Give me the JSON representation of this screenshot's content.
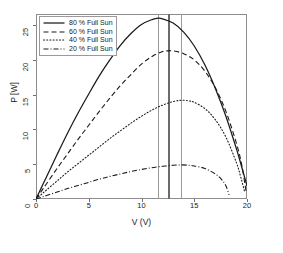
{
  "chart_data": {
    "type": "line",
    "title": "",
    "xlabel": "V (V)",
    "ylabel": "P [W]",
    "xlim": [
      0,
      20
    ],
    "ylim": [
      0,
      26.6
    ],
    "xticks": [
      "0",
      "5",
      "10",
      "15",
      "20"
    ],
    "xtick_values": [
      0,
      5,
      10,
      15,
      20
    ],
    "yticks": [
      "0",
      "5",
      "10",
      "15",
      "20",
      "25"
    ],
    "ytick_values": [
      0,
      5,
      10,
      15,
      20,
      25
    ],
    "grid": false,
    "legend_position": "upper left",
    "series": [
      {
        "name": "80 % Full Sun",
        "style": "solid",
        "color": "#1a1a1a",
        "peak_v": 11.6,
        "peak_p": 26.0,
        "v_end": 20.0,
        "x": [
          0,
          0.5,
          1,
          2,
          3,
          4,
          5,
          6,
          7,
          8,
          9,
          10,
          11,
          11.6,
          12,
          13,
          14,
          15,
          16,
          17,
          18,
          19,
          19.5,
          20
        ],
        "y": [
          0,
          1.6,
          3.2,
          6.4,
          9.5,
          12.4,
          15.1,
          17.7,
          20.0,
          22.1,
          23.8,
          25.1,
          25.8,
          26.0,
          25.9,
          25.3,
          24.0,
          22.0,
          19.3,
          15.9,
          11.9,
          7.2,
          4.6,
          1.9
        ]
      },
      {
        "name": "60 % Full Sun",
        "style": "dashed",
        "color": "#1a1a1a",
        "peak_v": 12.6,
        "peak_p": 21.3,
        "v_end": 19.9,
        "x": [
          0,
          0.5,
          1,
          2,
          3,
          4,
          5,
          6,
          7,
          8,
          9,
          10,
          11,
          12,
          12.6,
          13,
          14,
          15,
          16,
          17,
          18,
          19,
          19.5,
          19.9
        ],
        "y": [
          0,
          1.1,
          2.2,
          4.4,
          6.5,
          8.6,
          10.6,
          12.6,
          14.5,
          16.3,
          17.9,
          19.4,
          20.5,
          21.2,
          21.3,
          21.3,
          20.9,
          20.0,
          18.4,
          16.0,
          12.6,
          8.0,
          4.9,
          1.2
        ]
      },
      {
        "name": "40 % Full Sun",
        "style": "dotted",
        "color": "#1a1a1a",
        "peak_v": 13.8,
        "peak_p": 14.2,
        "v_end": 19.8,
        "x": [
          0,
          0.5,
          1,
          2,
          3,
          4,
          5,
          6,
          7,
          8,
          9,
          10,
          11,
          12,
          13,
          13.8,
          14.5,
          15,
          16,
          17,
          18,
          19,
          19.4,
          19.8
        ],
        "y": [
          0,
          0.65,
          1.3,
          2.6,
          3.9,
          5.1,
          6.3,
          7.5,
          8.7,
          9.8,
          10.9,
          11.9,
          12.8,
          13.5,
          14.0,
          14.2,
          14.1,
          13.9,
          13.0,
          11.4,
          8.9,
          5.2,
          3.2,
          0.9
        ]
      },
      {
        "name": "20 % Full Sun",
        "style": "dashdot",
        "color": "#1a1a1a",
        "peak_v": 13.8,
        "peak_p": 4.9,
        "v_end": 18.3,
        "x": [
          0,
          0.5,
          1,
          2,
          3,
          4,
          5,
          6,
          7,
          8,
          9,
          10,
          11,
          12,
          13,
          13.8,
          14.5,
          15,
          16,
          17,
          17.6,
          18,
          18.3
        ],
        "y": [
          0,
          0.25,
          0.5,
          1.0,
          1.5,
          1.95,
          2.4,
          2.85,
          3.25,
          3.6,
          3.95,
          4.25,
          4.5,
          4.7,
          4.85,
          4.9,
          4.85,
          4.75,
          4.4,
          3.6,
          2.8,
          1.9,
          0.6
        ]
      }
    ],
    "reference_lines": [
      {
        "name": "vline-1",
        "v": 11.6,
        "color": "#9a9a9a",
        "width": 1
      },
      {
        "name": "vline-2",
        "v": 12.6,
        "color": "#6b6b6b",
        "width": 2
      },
      {
        "name": "vline-3",
        "v": 13.8,
        "color": "#9a9a9a",
        "width": 1
      }
    ]
  },
  "legend": {
    "entries": [
      {
        "label": "80 % Full Sun"
      },
      {
        "label": "60 % Full Sun"
      },
      {
        "label": "40 % Full Sun"
      },
      {
        "label": "20 % Full Sun"
      }
    ]
  },
  "axes": {
    "xlabel": "V (V)",
    "ylabel": "P [W]"
  }
}
